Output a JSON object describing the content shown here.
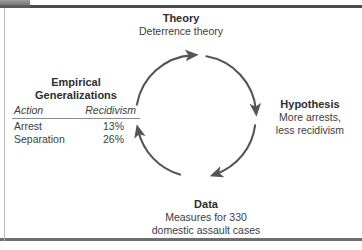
{
  "figure": {
    "kind": "research-cycle-diagram",
    "colors": {
      "text": "#3a3a3a",
      "title": "#2e2e30",
      "arrow": "#555557",
      "rule": "#4a4a4c",
      "table_rule": "#8d8d8f"
    }
  },
  "nodes": {
    "theory": {
      "title": "Theory",
      "body": "Deterrence theory"
    },
    "hypothesis": {
      "title": "Hypothesis",
      "body_line1": "More arrests,",
      "body_line2": "less recidivism"
    },
    "data": {
      "title": "Data",
      "body_line1": "Measures for 330",
      "body_line2": "domestic assault cases"
    },
    "empirical": {
      "title_line1": "Empirical",
      "title_line2": "Generalizations",
      "table": {
        "headers": [
          "Action",
          "Recidivism"
        ],
        "rows": [
          [
            "Arrest",
            "13%"
          ],
          [
            "Separation",
            "26%"
          ]
        ]
      }
    }
  },
  "arrows": {
    "direction": "clockwise",
    "segments": [
      {
        "name": "empirical-to-theory",
        "from": "Empirical Generalizations",
        "to": "Theory"
      },
      {
        "name": "theory-to-hypothesis",
        "from": "Theory",
        "to": "Hypothesis"
      },
      {
        "name": "hypothesis-to-data",
        "from": "Hypothesis",
        "to": "Data"
      },
      {
        "name": "data-to-empirical",
        "from": "Data",
        "to": "Empirical Generalizations"
      }
    ]
  }
}
